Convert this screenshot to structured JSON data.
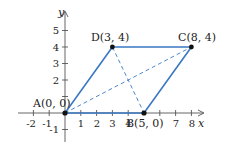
{
  "figure": {
    "type": "parallelogram-on-coordinate-plane",
    "axes": {
      "x_label": "x",
      "y_label": "y",
      "x_ticks": [
        "-2",
        "-1",
        "1",
        "2",
        "3",
        "4",
        "7",
        "8"
      ],
      "y_ticks": [
        "5",
        "4",
        "3",
        "2",
        "-1"
      ]
    },
    "points": [
      {
        "name": "A",
        "label": "A(0, 0)",
        "x": 0,
        "y": 0
      },
      {
        "name": "B",
        "label": "B(5, 0)",
        "x": 5,
        "y": 0
      },
      {
        "name": "C",
        "label": "C(8, 4)",
        "x": 8,
        "y": 4
      },
      {
        "name": "D",
        "label": "D(3, 4)",
        "x": 3,
        "y": 4
      }
    ],
    "sides": [
      "AB",
      "BC",
      "CD",
      "DA"
    ],
    "diagonals_dashed": [
      "AC",
      "BD"
    ],
    "colors": {
      "edge": "#3a78c3",
      "axis": "#555555",
      "point": "#111111"
    }
  }
}
